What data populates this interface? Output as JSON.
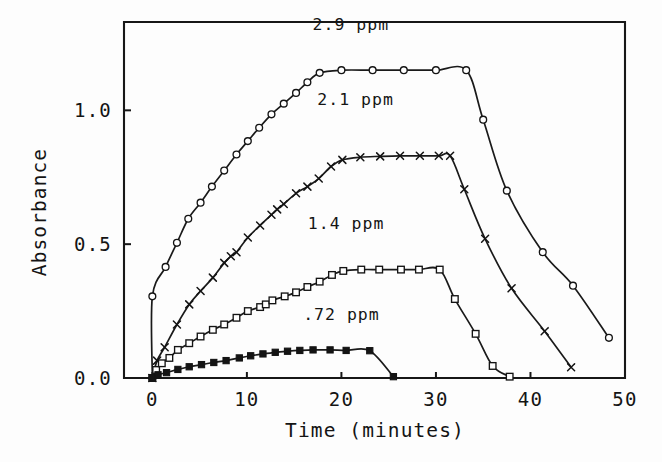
{
  "figure": {
    "background_color": "#fdfdfd",
    "ink_color": "#141414"
  },
  "chart_data": {
    "type": "line",
    "title": "",
    "subtitle": "",
    "xlabel": "Time  (minutes)",
    "ylabel": "Absorbance",
    "xlim": [
      -3,
      50
    ],
    "ylim": [
      0.0,
      1.33
    ],
    "xticks": [
      0,
      10,
      20,
      30,
      40,
      50
    ],
    "xtick_labels": [
      "0",
      "10",
      "20",
      "30",
      "40",
      "50"
    ],
    "yticks": [
      0.0,
      0.5,
      1.0
    ],
    "ytick_labels": [
      "0.0",
      "0.5",
      "1.0"
    ],
    "grid": false,
    "legend": "inline-annotations",
    "series": [
      {
        "name": "2.9 ppm",
        "annotation": "2.9 ppm",
        "marker": "open-circle",
        "annotation_x": 21.0,
        "annotation_y": 1.3,
        "x": [
          0,
          0,
          1.4,
          2.6,
          3.8,
          5.1,
          6.3,
          7.6,
          8.9,
          10.1,
          11.3,
          12.6,
          13.9,
          15.2,
          16.4,
          17.7,
          20.0,
          23.3,
          26.6,
          30.0,
          33.2,
          35.0,
          37.5,
          41.3,
          44.5,
          48.3
        ],
        "y": [
          0.0,
          0.305,
          0.415,
          0.505,
          0.595,
          0.655,
          0.715,
          0.775,
          0.835,
          0.885,
          0.935,
          0.985,
          1.025,
          1.065,
          1.105,
          1.14,
          1.15,
          1.15,
          1.15,
          1.15,
          1.15,
          0.965,
          0.7,
          0.47,
          0.345,
          0.15
        ],
        "plateau_value": 1.15,
        "plateau_start": 17.7,
        "plateau_end": 33.2
      },
      {
        "name": "2.1 ppm",
        "annotation": "2.1 ppm",
        "marker": "cross",
        "annotation_x": 21.5,
        "annotation_y": 1.02,
        "x": [
          0,
          0.5,
          1.3,
          2.6,
          3.9,
          5.1,
          6.4,
          7.6,
          8.3,
          8.9,
          10.1,
          11.4,
          12.6,
          13.2,
          13.9,
          15.2,
          16.4,
          17.6,
          18.9,
          20.1,
          22.0,
          24.1,
          26.2,
          28.3,
          30.3,
          31.5,
          33.0,
          35.2,
          38.0,
          41.5,
          44.3
        ],
        "y": [
          0.0,
          0.065,
          0.115,
          0.2,
          0.275,
          0.325,
          0.375,
          0.43,
          0.455,
          0.47,
          0.525,
          0.57,
          0.61,
          0.63,
          0.65,
          0.69,
          0.715,
          0.745,
          0.79,
          0.815,
          0.825,
          0.828,
          0.83,
          0.83,
          0.83,
          0.83,
          0.705,
          0.52,
          0.335,
          0.175,
          0.04
        ],
        "plateau_value": 0.83,
        "plateau_start": 20.1,
        "plateau_end": 31.5
      },
      {
        "name": "1.4 ppm",
        "annotation": "1.4 ppm",
        "marker": "open-square",
        "annotation_x": 20.5,
        "annotation_y": 0.555,
        "x": [
          0,
          0.4,
          1.0,
          1.8,
          2.7,
          3.9,
          5.1,
          6.4,
          7.6,
          8.9,
          10.1,
          11.4,
          12.0,
          12.7,
          14.0,
          15.2,
          16.4,
          17.7,
          19.0,
          20.2,
          22.1,
          24.0,
          26.3,
          28.2,
          30.4,
          32.0,
          34.2,
          36.0,
          37.8
        ],
        "y": [
          0.0,
          0.03,
          0.055,
          0.075,
          0.105,
          0.13,
          0.155,
          0.18,
          0.2,
          0.225,
          0.25,
          0.265,
          0.275,
          0.29,
          0.305,
          0.32,
          0.34,
          0.36,
          0.385,
          0.4,
          0.405,
          0.405,
          0.405,
          0.405,
          0.405,
          0.295,
          0.165,
          0.045,
          0.005
        ],
        "plateau_value": 0.405,
        "plateau_start": 20.2,
        "plateau_end": 30.4
      },
      {
        "name": ".72 ppm",
        "annotation": ".72 ppm",
        "marker": "filled-square",
        "annotation_x": 20.0,
        "annotation_y": 0.215,
        "x": [
          0,
          0.6,
          1.5,
          2.7,
          3.9,
          5.2,
          6.5,
          7.8,
          9.2,
          10.4,
          11.7,
          13.0,
          14.3,
          15.6,
          17.0,
          18.8,
          20.5,
          23.0,
          25.5
        ],
        "y": [
          0.0,
          0.012,
          0.02,
          0.032,
          0.042,
          0.05,
          0.058,
          0.065,
          0.075,
          0.083,
          0.09,
          0.096,
          0.1,
          0.103,
          0.105,
          0.105,
          0.103,
          0.102,
          0.005
        ],
        "plateau_value": 0.105,
        "plateau_start": 17.0,
        "plateau_end": 23.0
      }
    ]
  }
}
